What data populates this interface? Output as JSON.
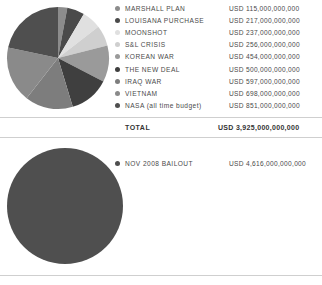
{
  "chart_data": {
    "type": "pie",
    "title": "",
    "charts": [
      {
        "name": "major-us-expenditures",
        "categories": [
          "MARSHALL PLAN",
          "LOUISANA PURCHASE",
          "MOONSHOT",
          "S&L CRISIS",
          "KOREAN WAR",
          "THE NEW DEAL",
          "IRAQ WAR",
          "VIETNAM",
          "NASA (all time budget)"
        ],
        "values": [
          115000000000,
          217000000000,
          237000000000,
          256000000000,
          454000000000,
          500000000000,
          597000000000,
          698000000000,
          851000000000
        ],
        "value_labels": [
          "USD 115,000,000,000",
          "USD 217,000,000,000",
          "USD 237,000,000,000",
          "USD 256,000,000,000",
          "USD 454,000,000,000",
          "USD 500,000,000,000",
          "USD 597,000,000,000",
          "USD 698,000,000,000",
          "USD 851,000,000,000"
        ],
        "colors": [
          "#8c8c8c",
          "#4a4a4a",
          "#e0e0e0",
          "#cfcfcf",
          "#9a9a9a",
          "#3f3f3f",
          "#7d7d7d",
          "#8a8a8a",
          "#4f4f4f"
        ],
        "total": 3925000000000,
        "total_label": "USD 3,925,000,000,000",
        "total_title": "TOTAL",
        "legend_position": "right",
        "start_angle": 0
      },
      {
        "name": "bailout",
        "categories": [
          "NOV 2008 BAILOUT"
        ],
        "values": [
          4616000000000
        ],
        "value_labels": [
          "USD 4,616,000,000,000"
        ],
        "colors": [
          "#4f4f4f"
        ],
        "legend_position": "right"
      }
    ]
  },
  "section1": {
    "legend": [
      {
        "label": "MARSHALL PLAN",
        "value": "USD 115,000,000,000",
        "color": "#8c8c8c"
      },
      {
        "label": "LOUISANA PURCHASE",
        "value": "USD 217,000,000,000",
        "color": "#4a4a4a"
      },
      {
        "label": "MOONSHOT",
        "value": "USD 237,000,000,000",
        "color": "#e0e0e0"
      },
      {
        "label": "S&L CRISIS",
        "value": "USD 256,000,000,000",
        "color": "#cfcfcf"
      },
      {
        "label": "KOREAN WAR",
        "value": "USD 454,000,000,000",
        "color": "#9a9a9a"
      },
      {
        "label": "THE NEW DEAL",
        "value": "USD 500,000,000,000",
        "color": "#3f3f3f"
      },
      {
        "label": "IRAQ WAR",
        "value": "USD 597,000,000,000",
        "color": "#7d7d7d"
      },
      {
        "label": "VIETNAM",
        "value": "USD 698,000,000,000",
        "color": "#8a8a8a"
      },
      {
        "label": "NASA (all time budget)",
        "value": "USD 851,000,000,000",
        "color": "#4f4f4f"
      }
    ],
    "total": {
      "label": "TOTAL",
      "value": "USD 3,925,000,000,000"
    }
  },
  "section2": {
    "legend": [
      {
        "label": "NOV 2008 BAILOUT",
        "value": "USD 4,616,000,000,000",
        "color": "#4f4f4f"
      }
    ]
  }
}
